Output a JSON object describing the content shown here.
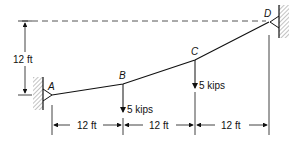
{
  "diagram": {
    "type": "cable-with-point-loads",
    "points": [
      {
        "id": "A",
        "label": "A",
        "x": 52,
        "y": 95
      },
      {
        "id": "B",
        "label": "B",
        "x": 123,
        "y": 84
      },
      {
        "id": "C",
        "label": "C",
        "x": 195,
        "y": 60
      },
      {
        "id": "D",
        "label": "D",
        "x": 269,
        "y": 22
      }
    ],
    "loads": [
      {
        "at": "B",
        "label": "5 kips"
      },
      {
        "at": "C",
        "label": "5 kips"
      }
    ],
    "dimensions": {
      "vertical": "12 ft",
      "horizontal": [
        "12 ft",
        "12 ft",
        "12 ft"
      ]
    },
    "colors": {
      "line": "#111111",
      "hatch": "#888888",
      "dash": "#555555"
    }
  }
}
